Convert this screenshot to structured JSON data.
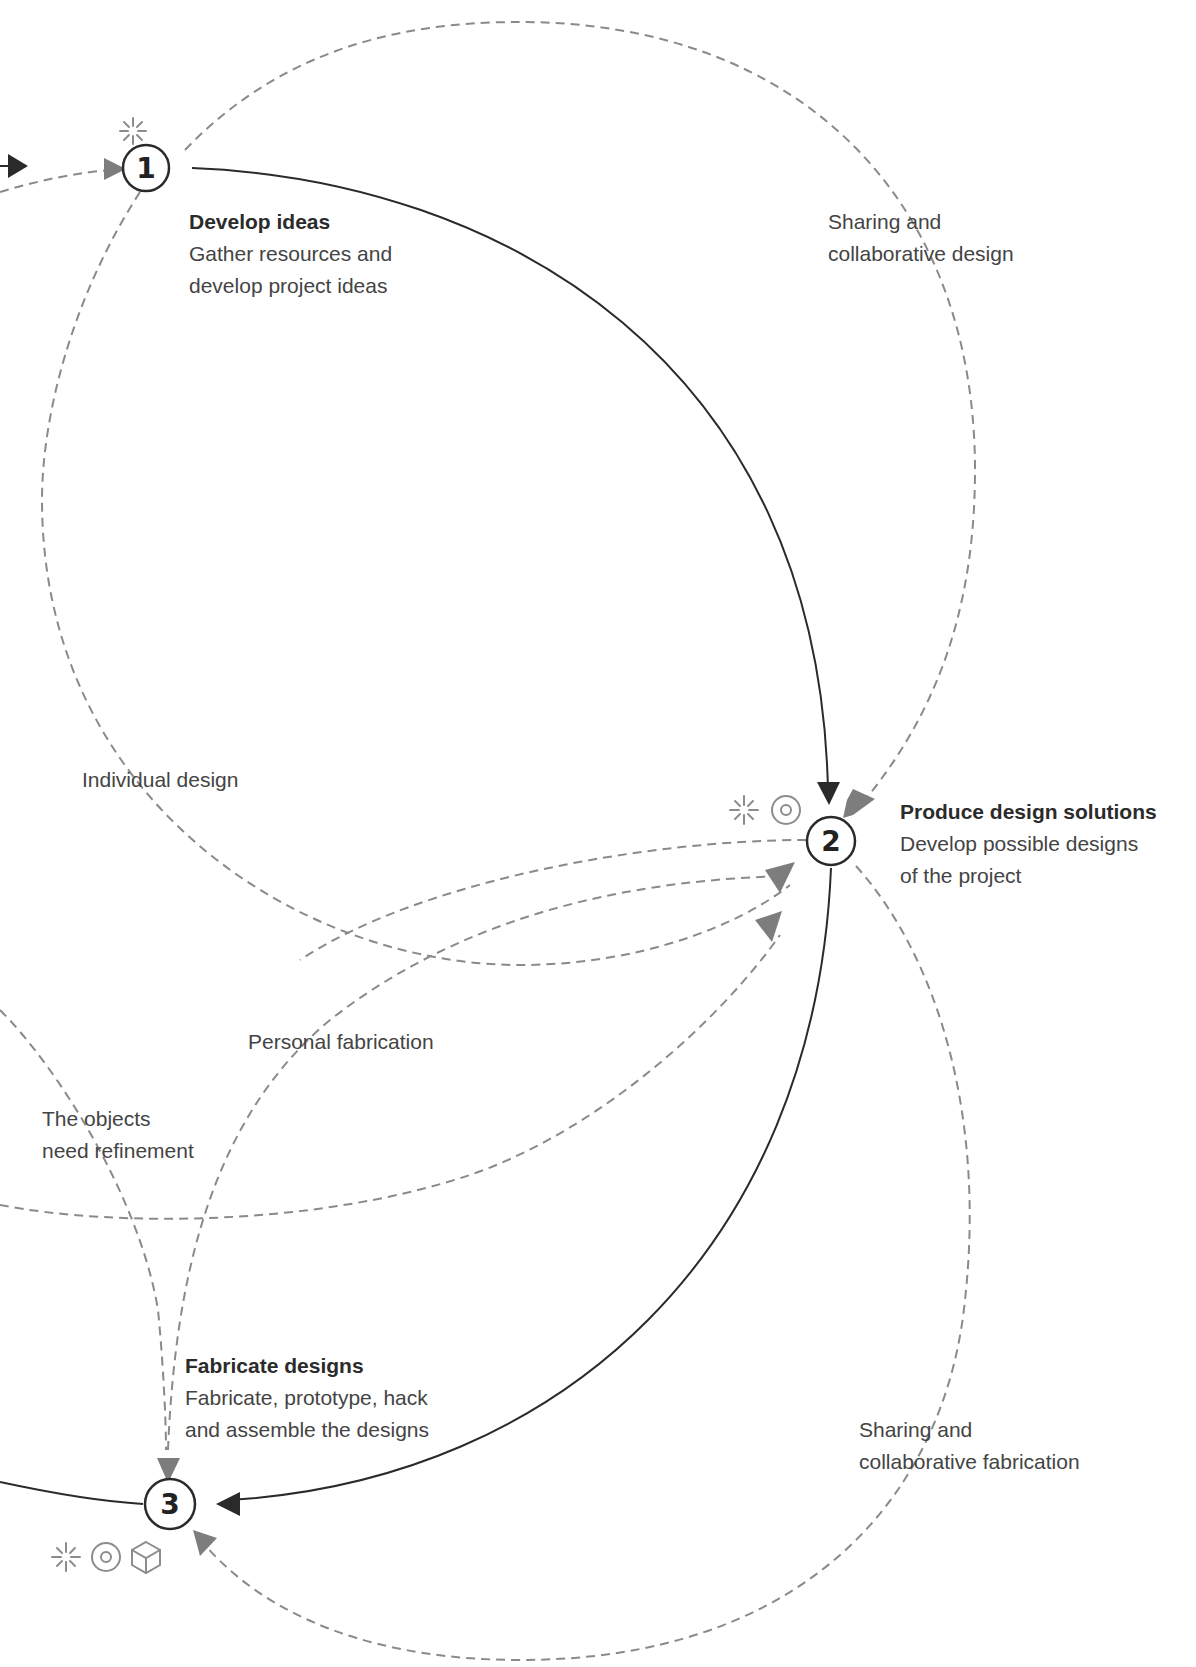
{
  "top_clipped_text": "...",
  "nodes": [
    {
      "number": "1",
      "title": "Develop ideas",
      "description_lines": [
        "Gather resources and",
        "develop project ideas"
      ],
      "icons": [
        "sparkle-icon"
      ]
    },
    {
      "number": "2",
      "title": "Produce design solutions",
      "description_lines": [
        "Develop possible designs",
        "of the project"
      ],
      "icons": [
        "sparkle-icon",
        "target-icon"
      ]
    },
    {
      "number": "3",
      "title": "Fabricate designs",
      "description_lines": [
        "Fabricate, prototype, hack",
        "and assemble the designs"
      ],
      "icons": [
        "sparkle-icon",
        "target-icon",
        "cube-icon"
      ]
    }
  ],
  "path_labels": {
    "sharing_design": [
      "Sharing and",
      "collaborative design"
    ],
    "individual_design": "Individual design",
    "personal_fabrication": "Personal fabrication",
    "objects_refinement": [
      "The objects",
      "need refinement"
    ],
    "sharing_fabrication": [
      "Sharing and",
      "collaborative fabrication"
    ]
  },
  "colors": {
    "solid_line": "#2a2a2a",
    "dashed_line": "#8a8a8a",
    "dashed_arrow": "#7d7d7d",
    "icon": "#8c8c8c"
  }
}
